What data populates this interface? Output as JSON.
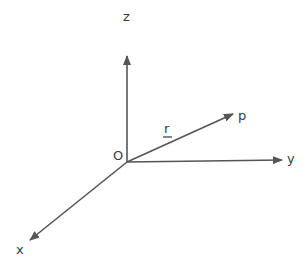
{
  "diagram": {
    "type": "3d-coordinate-axes",
    "stroke_color": "#555555",
    "label_color": "#3a3a3a",
    "origin": {
      "label": "O"
    },
    "axes": [
      {
        "name": "z",
        "label": "z",
        "direction": "up"
      },
      {
        "name": "y",
        "label": "y",
        "direction": "right"
      },
      {
        "name": "x",
        "label": "x",
        "direction": "down-left"
      }
    ],
    "vector": {
      "label": "r",
      "underlined": true,
      "endpoint_label": "p"
    }
  }
}
